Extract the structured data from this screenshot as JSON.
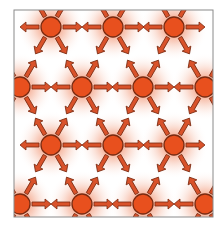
{
  "figure": {
    "colors": {
      "node_fill": "#e8501e",
      "node_stroke": "#7a2a10",
      "arrow_fill": "#d9522a",
      "arrow_stroke": "#7a2a10",
      "glow": "#e8501e",
      "frame": "#8a8a8a",
      "background": "#ffffff"
    },
    "frame": {
      "x": 14,
      "y": 10,
      "width": 199,
      "height": 207
    },
    "node_radius": 10,
    "arrow_directions_deg": [
      0,
      60,
      120,
      180,
      240,
      300
    ],
    "nodes": [
      {
        "x": 51,
        "y": 27
      },
      {
        "x": 113,
        "y": 27
      },
      {
        "x": 174,
        "y": 27
      },
      {
        "x": 20,
        "y": 87
      },
      {
        "x": 82,
        "y": 87
      },
      {
        "x": 143,
        "y": 87
      },
      {
        "x": 205,
        "y": 87
      },
      {
        "x": 51,
        "y": 145
      },
      {
        "x": 113,
        "y": 145
      },
      {
        "x": 174,
        "y": 145
      },
      {
        "x": 20,
        "y": 204
      },
      {
        "x": 82,
        "y": 204
      },
      {
        "x": 143,
        "y": 204
      },
      {
        "x": 205,
        "y": 204
      }
    ]
  }
}
